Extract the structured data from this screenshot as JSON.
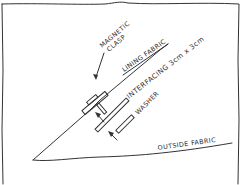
{
  "diagram": {
    "type": "hand-drawn sewing cross-section sketch",
    "colors": {
      "ink": "#333333",
      "background": "#ffffff"
    },
    "labels": {
      "magnetic_clasp_line1": "MAGNETIC",
      "magnetic_clasp_line2": "CLASP",
      "lining_fabric": "LINING FABRIC",
      "interfacing": "INTERFACING 3cm x 3cm",
      "washer": "WASHER",
      "outside_fabric": "OUTSIDE FABRIC"
    },
    "components": [
      {
        "name": "frame",
        "description": "hand-drawn rectangular border"
      },
      {
        "name": "lining-fabric-line",
        "description": "diagonal line from bottom-left apex up to top-right"
      },
      {
        "name": "outside-fabric-line",
        "description": "near-horizontal line from apex to right"
      },
      {
        "name": "magnetic-clasp",
        "description": "clasp piece with prong through lining fabric"
      },
      {
        "name": "interfacing",
        "description": "long thin rectangle parallel to lining"
      },
      {
        "name": "washer",
        "description": "short thin rectangle parallel to interfacing"
      },
      {
        "name": "arrows",
        "description": "three arrows pointing to clasp, interfacing, washer"
      }
    ]
  }
}
